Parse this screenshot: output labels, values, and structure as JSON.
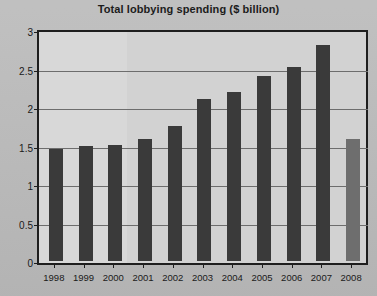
{
  "chart_data": {
    "type": "bar",
    "title": "Total lobbying spending ($ billion)",
    "xlabel": "",
    "ylabel": "",
    "categories": [
      "1998",
      "1999",
      "2000",
      "2001",
      "2002",
      "2003",
      "2004",
      "2005",
      "2006",
      "2007",
      "2008"
    ],
    "values": [
      1.45,
      1.5,
      1.51,
      1.59,
      1.75,
      2.1,
      2.2,
      2.4,
      2.52,
      2.8,
      1.59
    ],
    "series": [
      {
        "name": "Total lobbying spending",
        "values": [
          1.45,
          1.5,
          1.51,
          1.59,
          1.75,
          2.1,
          2.2,
          2.4,
          2.52,
          2.8,
          1.59
        ]
      }
    ],
    "ylim": [
      0,
      3
    ],
    "yticks": [
      0,
      0.5,
      1,
      1.5,
      2,
      2.5,
      3
    ],
    "ytick_labels": [
      "0",
      "0.5",
      "1",
      "1.5",
      "2",
      "2.5",
      "3"
    ],
    "grid": true,
    "legend": "none",
    "bar_colors": [
      "#3a3a3a",
      "#3a3a3a",
      "#3a3a3a",
      "#3a3a3a",
      "#3a3a3a",
      "#3a3a3a",
      "#3a3a3a",
      "#3a3a3a",
      "#3a3a3a",
      "#3a3a3a",
      "#6e6e6e"
    ],
    "highlight_note": "2008 bar shown in lighter gray (partial year)"
  },
  "colors": {
    "page_background": "#bdbdbd",
    "plot_background": "#d2d2d2",
    "axis": "#1e1e1e",
    "gridline": "#6d6d6d",
    "bar": "#3a3a3a",
    "bar_partial": "#6e6e6e",
    "text": "#1a1a1a"
  }
}
